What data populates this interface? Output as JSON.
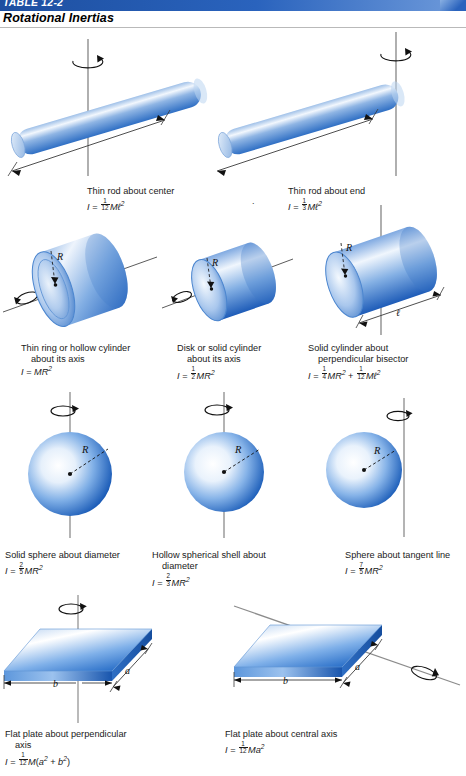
{
  "header": {
    "table_number": "TABLE 12-2",
    "title": "Rotational Inertias",
    "bar_color": "#2a63bd"
  },
  "figures": [
    {
      "name": "thin-rod-about-center",
      "line1": "Thin rod about center",
      "formula": "I = 1/12 Mℓ²",
      "frac_n": "1",
      "frac_d": "12",
      "labels": [
        "ℓ"
      ]
    },
    {
      "name": "thin-rod-about-end",
      "line1": "Thin rod about end",
      "formula": "I = 1/3 Mℓ²",
      "frac_n": "1",
      "frac_d": "3",
      "labels": [
        "ℓ"
      ]
    },
    {
      "name": "thin-ring-or-hollow-cylinder",
      "line1": "Thin ring or hollow cylinder",
      "line2": "about its axis",
      "formula": "I = MR²",
      "labels": [
        "R"
      ]
    },
    {
      "name": "disk-or-solid-cylinder",
      "line1": "Disk or solid cylinder",
      "line2": "about its axis",
      "formula": "I = 1/2 MR²",
      "frac_n": "1",
      "frac_d": "2",
      "labels": [
        "R"
      ]
    },
    {
      "name": "solid-cylinder-perpendicular-bisector",
      "line1": "Solid cylinder about",
      "line2": "perpendicular bisector",
      "formula": "I = 1/4 MR² + 1/12 Mℓ²",
      "frac1_n": "1",
      "frac1_d": "4",
      "frac2_n": "1",
      "frac2_d": "12",
      "labels": [
        "R",
        "ℓ"
      ]
    },
    {
      "name": "solid-sphere-about-diameter",
      "line1": "Solid sphere about diameter",
      "formula": "I = 2/5 MR²",
      "frac_n": "2",
      "frac_d": "5",
      "labels": [
        "R"
      ]
    },
    {
      "name": "hollow-spherical-shell-about-diameter",
      "line1": "Hollow spherical shell about",
      "line2": "diameter",
      "formula": "I = 2/3 MR²",
      "frac_n": "2",
      "frac_d": "3",
      "labels": [
        "R"
      ]
    },
    {
      "name": "sphere-about-tangent-line",
      "line1": "Sphere about tangent line",
      "formula": "I = 7/5 MR²",
      "frac_n": "7",
      "frac_d": "5",
      "labels": [
        "R"
      ]
    },
    {
      "name": "flat-plate-about-perpendicular-axis",
      "line1": "Flat plate about perpendicular",
      "line2": "axis",
      "formula": "I = 1/12 M(a² + b²)",
      "frac_n": "1",
      "frac_d": "12",
      "labels": [
        "a",
        "b"
      ]
    },
    {
      "name": "flat-plate-about-central-axis",
      "line1": "Flat plate about central axis",
      "formula": "I = 1/12 Ma²",
      "frac_n": "1",
      "frac_d": "12",
      "labels": [
        "a",
        "b"
      ]
    }
  ]
}
